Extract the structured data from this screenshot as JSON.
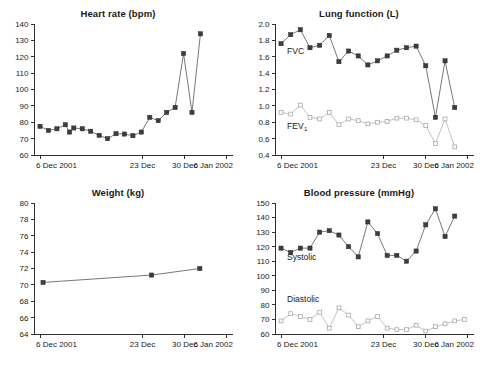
{
  "figure": {
    "title": "",
    "panel_count": 4
  },
  "chart_data": [
    {
      "type": "line",
      "id": "heart-rate",
      "title": "Heart rate (bpm)",
      "xlabel": "",
      "ylabel": "",
      "ylim": [
        60,
        140
      ],
      "yticks": [
        60,
        70,
        80,
        90,
        100,
        110,
        120,
        130,
        140
      ],
      "ytick_labels": [
        "60",
        "70",
        "80",
        "90",
        "100",
        "110",
        "120",
        "130",
        "140"
      ],
      "xlim": [
        0,
        33
      ],
      "xticks": [
        1,
        18,
        25,
        32
      ],
      "xtick_labels": [
        "6 Dec 2001",
        "23 Dec",
        "30 Dec",
        "6 Jan 2002"
      ],
      "grid": false,
      "legend": "none",
      "series": [
        {
          "name": "Heart rate",
          "marker": "filled-square",
          "x": [
            1,
            2.4,
            3.8,
            5.2,
            5.9,
            6.6,
            8.0,
            9.4,
            10.8,
            12.2,
            13.6,
            15.0,
            16.4,
            17.8,
            19.2,
            20.6,
            22.0,
            23.4,
            24.8,
            26.2,
            27.6,
            29.0,
            30.4,
            32.6
          ],
          "values": [
            77.5,
            75,
            76,
            78.5,
            74,
            76.5,
            76,
            74.5,
            72,
            70,
            73,
            72.8,
            71.8,
            74,
            83,
            81,
            86,
            89,
            122,
            86,
            134
          ]
        }
      ]
    },
    {
      "type": "line",
      "id": "lung-function",
      "title": "Lung function (L)",
      "xlabel": "",
      "ylabel": "",
      "ylim": [
        0.4,
        2.0
      ],
      "yticks": [
        0.4,
        0.6,
        0.8,
        1.0,
        1.2,
        1.4,
        1.6,
        1.8,
        2.0
      ],
      "ytick_labels": [
        "0.4",
        "0.6",
        "0.8",
        "1.0",
        "1.2",
        "1.4",
        "1.6",
        "1.8",
        "2.0"
      ],
      "xlim": [
        0,
        33
      ],
      "xticks": [
        1,
        18,
        25,
        32
      ],
      "xtick_labels": [
        "6 Dec 2001",
        "23 Dec",
        "30 Dec",
        "6 Jan 2002"
      ],
      "grid": false,
      "legend": "inline-labels",
      "annotations": [
        {
          "text": "FVC",
          "x": 2.0,
          "y": 1.63
        },
        {
          "text": "FEV",
          "subscript": "1",
          "x": 2.0,
          "y": 0.72
        }
      ],
      "series": [
        {
          "name": "FVC",
          "marker": "filled-square",
          "x": [
            1,
            2.6,
            4.2,
            5.8,
            7.4,
            9.0,
            10.6,
            12.2,
            13.8,
            15.4,
            17.0,
            18.6,
            20.2,
            21.8,
            23.4,
            25.0,
            26.6,
            28.2,
            29.8,
            31.4
          ],
          "values": [
            1.76,
            1.87,
            1.93,
            1.71,
            1.74,
            1.86,
            1.54,
            1.67,
            1.61,
            1.5,
            1.55,
            1.61,
            1.68,
            1.71,
            1.73,
            1.49,
            0.86,
            1.55,
            0.98
          ]
        },
        {
          "name": "FEV1",
          "marker": "open-square",
          "x": [
            1,
            2.6,
            4.2,
            5.8,
            7.4,
            9.0,
            10.6,
            12.2,
            13.8,
            15.4,
            17.0,
            18.6,
            20.2,
            21.8,
            23.4,
            25.0,
            26.6,
            28.2,
            29.8,
            31.4
          ],
          "values": [
            0.92,
            0.9,
            1.01,
            0.86,
            0.84,
            0.92,
            0.77,
            0.84,
            0.82,
            0.78,
            0.8,
            0.81,
            0.85,
            0.85,
            0.83,
            0.76,
            0.54,
            0.84,
            0.5
          ]
        }
      ]
    },
    {
      "type": "line",
      "id": "weight",
      "title": "Weight (kg)",
      "xlabel": "",
      "ylabel": "",
      "ylim": [
        64,
        80
      ],
      "yticks": [
        64,
        66,
        68,
        70,
        72,
        74,
        76,
        78,
        80
      ],
      "ytick_labels": [
        "64",
        "66",
        "68",
        "70",
        "72",
        "74",
        "76",
        "78",
        "80"
      ],
      "xlim": [
        0,
        33
      ],
      "xticks": [
        1,
        18,
        25,
        32
      ],
      "xtick_labels": [
        "6 Dec 2001",
        "23 Dec",
        "30 Dec",
        "6 Jan 2002"
      ],
      "grid": false,
      "legend": "none",
      "series": [
        {
          "name": "Weight",
          "marker": "filled-square",
          "x": [
            1.5,
            19.5,
            27.5
          ],
          "values": [
            70.3,
            71.2,
            72.0
          ]
        }
      ]
    },
    {
      "type": "line",
      "id": "blood-pressure",
      "title": "Blood pressure (mmHg)",
      "xlabel": "",
      "ylabel": "",
      "ylim": [
        60,
        150
      ],
      "yticks": [
        60,
        70,
        80,
        90,
        100,
        110,
        120,
        130,
        140,
        150
      ],
      "ytick_labels": [
        "60",
        "70",
        "80",
        "90",
        "100",
        "110",
        "120",
        "130",
        "140",
        "150"
      ],
      "xlim": [
        0,
        33
      ],
      "xticks": [
        1,
        18,
        25,
        32
      ],
      "xtick_labels": [
        "6 Dec 2001",
        "23 Dec",
        "30 Dec",
        "6 Jan 2002"
      ],
      "grid": false,
      "legend": "inline-labels",
      "annotations": [
        {
          "text": "Systolic",
          "x": 2.0,
          "y": 111
        },
        {
          "text": "Diastolic",
          "x": 2.0,
          "y": 82
        }
      ],
      "series": [
        {
          "name": "Systolic",
          "marker": "filled-square",
          "x": [
            1,
            2.6,
            4.2,
            5.8,
            7.4,
            9.0,
            10.6,
            12.2,
            13.8,
            15.4,
            17.0,
            18.6,
            20.2,
            21.8,
            23.4,
            25.0,
            26.6,
            28.2,
            29.8,
            31.4
          ],
          "values": [
            119,
            116,
            119,
            119,
            130,
            131,
            128,
            120,
            113,
            137,
            129,
            114,
            114,
            110,
            117,
            135,
            146,
            127,
            141
          ]
        },
        {
          "name": "Diastolic",
          "marker": "open-square",
          "x": [
            1,
            2.6,
            4.2,
            5.8,
            7.4,
            9.0,
            10.6,
            12.2,
            13.8,
            15.4,
            17.0,
            18.6,
            20.2,
            21.8,
            23.4,
            25.0,
            26.6,
            28.2,
            29.8,
            31.4
          ],
          "values": [
            69,
            74,
            72,
            70,
            75,
            64,
            78,
            73,
            65,
            69,
            72,
            64,
            63,
            63,
            66,
            62,
            65,
            67,
            69,
            70,
            65
          ]
        }
      ]
    }
  ],
  "colors": {
    "marker_dark": "#3d3d3d",
    "marker_light": "#ffffff",
    "line_dark": "#555555",
    "line_light": "#b3b3b3",
    "axis": "#1a1a1a",
    "background": "#ffffff"
  }
}
